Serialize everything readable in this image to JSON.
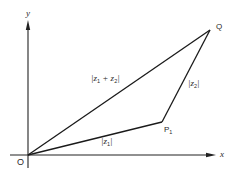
{
  "diagram": {
    "title": "",
    "axes": {
      "x_label": "x",
      "y_label": "y"
    },
    "points": {
      "origin": {
        "label": "O",
        "x": 28,
        "y": 155
      },
      "p1": {
        "label": "P",
        "subscript": "1",
        "x": 162,
        "y": 122
      },
      "q": {
        "label": "Q",
        "x": 210,
        "y": 30
      }
    },
    "segments": {
      "op1": {
        "label_prefix": "|z",
        "label_sub": "1",
        "label_suffix": "|"
      },
      "p1q": {
        "label_prefix": "|z",
        "label_sub": "2",
        "label_suffix": "|"
      },
      "oq": {
        "label_prefix": "|z",
        "label_sub1": "1",
        "label_mid": " + z",
        "label_sub2": "2",
        "label_suffix": "|"
      }
    },
    "colors": {
      "line": "#1a1a1a",
      "axis": "#222222",
      "text": "#2a2a2a",
      "background": "#ffffff"
    }
  }
}
